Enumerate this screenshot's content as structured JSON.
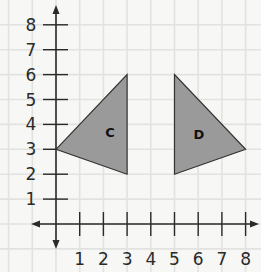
{
  "chart_data": {
    "type": "coordinate-plane",
    "title": "",
    "xlabel": "",
    "ylabel": "",
    "x_ticks": [
      "1",
      "2",
      "3",
      "4",
      "5",
      "6",
      "7",
      "8"
    ],
    "y_ticks": [
      "1",
      "2",
      "3",
      "4",
      "5",
      "6",
      "7",
      "8"
    ],
    "xlim": [
      -1,
      8.5
    ],
    "ylim": [
      -1.5,
      9
    ],
    "grid": true,
    "shapes": [
      {
        "name": "C",
        "type": "triangle",
        "vertices": [
          [
            0,
            3
          ],
          [
            3,
            6
          ],
          [
            3,
            2
          ]
        ]
      },
      {
        "name": "D",
        "type": "triangle",
        "vertices": [
          [
            5,
            6
          ],
          [
            5,
            2
          ],
          [
            8,
            3
          ]
        ]
      }
    ]
  },
  "labels": {
    "shape_c": "C",
    "shape_d": "D",
    "x": [
      "1",
      "2",
      "3",
      "4",
      "5",
      "6",
      "7",
      "8"
    ],
    "y": [
      "1",
      "2",
      "3",
      "4",
      "5",
      "6",
      "7",
      "8"
    ]
  },
  "colors": {
    "background": "#f7f7f5",
    "grid": "#e2e2e0",
    "axis": "#2a2a2a",
    "shape_fill": "#9a9a9a",
    "shape_stroke": "#333333"
  }
}
